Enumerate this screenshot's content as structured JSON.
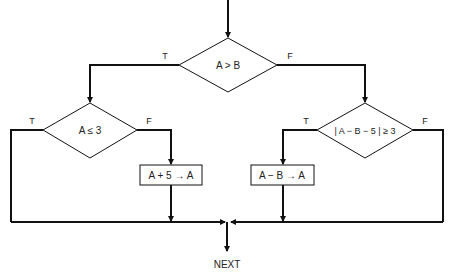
{
  "diagram": {
    "type": "flowchart",
    "nodes": {
      "decision_main": {
        "label": "A > B",
        "true_label": "T",
        "false_label": "F"
      },
      "decision_left": {
        "label": "A ≤ 3",
        "true_label": "T",
        "false_label": "F"
      },
      "decision_right": {
        "label": "| A − B − 5 | ≥ 3",
        "true_label": "T",
        "false_label": "F"
      },
      "process_left": {
        "label": "A + 5 → A"
      },
      "process_right": {
        "label": "A − B → A"
      },
      "terminal": {
        "label": "NEXT"
      }
    },
    "colors": {
      "line": "#111111",
      "background": "#ffffff",
      "text": "#222222"
    }
  }
}
